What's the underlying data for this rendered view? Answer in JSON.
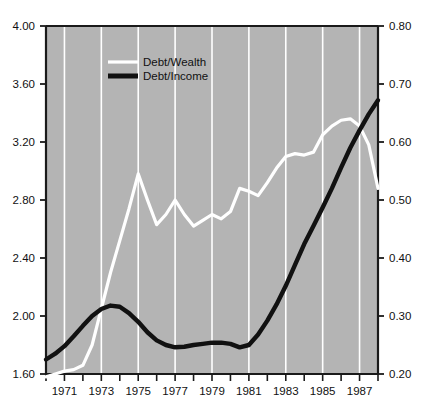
{
  "chart_data": {
    "type": "line",
    "title": "",
    "subtitle": "",
    "xlabel": "",
    "ylabel": "",
    "grid": "vertical-only",
    "legend_position": "top-left-inside",
    "plot_background_color": "#b4b4b4",
    "axis_color": "#1a1a1a",
    "gridline_color": "#ffffff",
    "x": [
      1970,
      1970.5,
      1971,
      1971.5,
      1972,
      1972.5,
      1973,
      1973.5,
      1974,
      1974.5,
      1975,
      1975.5,
      1976,
      1976.5,
      1977,
      1977.5,
      1978,
      1978.5,
      1979,
      1979.5,
      1980,
      1980.5,
      1981,
      1981.5,
      1982,
      1982.5,
      1983,
      1983.5,
      1984,
      1984.5,
      1985,
      1985.5,
      1986,
      1986.5,
      1987,
      1987.5,
      1988
    ],
    "xlim": [
      1970,
      1988
    ],
    "xticks": [
      1970,
      1971,
      1972,
      1973,
      1974,
      1975,
      1976,
      1977,
      1978,
      1979,
      1980,
      1981,
      1982,
      1983,
      1984,
      1985,
      1986,
      1987,
      1988
    ],
    "xtick_labels": [
      "",
      "1971",
      "",
      "1973",
      "",
      "1975",
      "",
      "1977",
      "",
      "1979",
      "",
      "1981",
      "",
      "1983",
      "",
      "1985",
      "",
      "1987",
      ""
    ],
    "gridline_years": [
      1971,
      1973,
      1975,
      1977,
      1979,
      1981,
      1983,
      1985,
      1987
    ],
    "series": [
      {
        "name": "Debt/Wealth",
        "axis": "left",
        "color": "#ffffff",
        "line_width": 3.2,
        "values": [
          1.58,
          1.6,
          1.62,
          1.63,
          1.66,
          1.8,
          2.05,
          2.3,
          2.52,
          2.74,
          2.98,
          2.8,
          2.63,
          2.7,
          2.8,
          2.7,
          2.62,
          2.66,
          2.7,
          2.67,
          2.72,
          2.88,
          2.86,
          2.83,
          2.92,
          3.02,
          3.1,
          3.12,
          3.11,
          3.13,
          3.25,
          3.31,
          3.35,
          3.36,
          3.31,
          3.18,
          2.88
        ]
      },
      {
        "name": "Debt/Income",
        "axis": "right",
        "color": "#111111",
        "line_width": 4.4,
        "values": [
          0.225,
          0.235,
          0.248,
          0.265,
          0.283,
          0.3,
          0.312,
          0.318,
          0.316,
          0.305,
          0.29,
          0.272,
          0.258,
          0.25,
          0.246,
          0.247,
          0.25,
          0.252,
          0.254,
          0.254,
          0.252,
          0.246,
          0.25,
          0.268,
          0.292,
          0.32,
          0.352,
          0.388,
          0.424,
          0.455,
          0.487,
          0.52,
          0.556,
          0.59,
          0.62,
          0.648,
          0.672
        ]
      }
    ],
    "left_axis": {
      "min": 1.6,
      "max": 4.0,
      "ticks": [
        1.6,
        2.0,
        2.4,
        2.8,
        3.2,
        3.6,
        4.0
      ],
      "tick_labels": [
        "1.60",
        "2.00",
        "2.40",
        "2.80",
        "3.20",
        "3.60",
        "4.00"
      ]
    },
    "right_axis": {
      "min": 0.2,
      "max": 0.8,
      "ticks": [
        0.2,
        0.3,
        0.4,
        0.5,
        0.6,
        0.7,
        0.8
      ],
      "tick_labels": [
        "0.20",
        "0.30",
        "0.40",
        "0.50",
        "0.60",
        "0.70",
        "0.80"
      ]
    },
    "legend": [
      {
        "label": "Debt/Wealth",
        "color": "#ffffff",
        "thickness": 3.2
      },
      {
        "label": "Debt/Income",
        "color": "#111111",
        "thickness": 5.0
      }
    ]
  }
}
